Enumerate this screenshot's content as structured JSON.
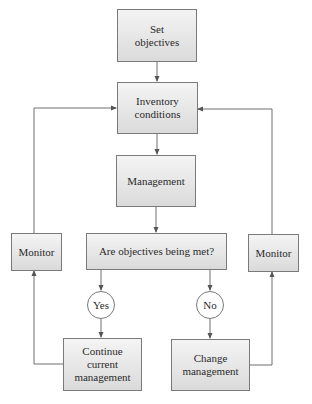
{
  "diagram": {
    "type": "flowchart",
    "nodes": {
      "set_objectives": "Set\nobjectives",
      "inventory_conditions": "Inventory\nconditions",
      "management": "Management",
      "question": "Are objectives being met?",
      "monitor_left": "Monitor",
      "monitor_right": "Monitor",
      "yes": "Yes",
      "no": "No",
      "continue_management": "Continue\ncurrent\nmanagement",
      "change_management": "Change\nmanagement"
    },
    "edges": [
      {
        "from": "Set objectives",
        "to": "Inventory conditions"
      },
      {
        "from": "Inventory conditions",
        "to": "Management"
      },
      {
        "from": "Management",
        "to": "Are objectives being met?"
      },
      {
        "from": "Are objectives being met?",
        "to": "Yes"
      },
      {
        "from": "Are objectives being met?",
        "to": "No"
      },
      {
        "from": "Yes",
        "to": "Continue current management"
      },
      {
        "from": "No",
        "to": "Change management"
      },
      {
        "from": "Continue current management",
        "to": "Monitor (left)"
      },
      {
        "from": "Monitor (left)",
        "to": "Inventory conditions"
      },
      {
        "from": "Change management",
        "to": "Monitor (right)"
      },
      {
        "from": "Monitor (right)",
        "to": "Inventory conditions"
      }
    ],
    "colors": {
      "line": "#6e6e6e",
      "box_border": "#7a7a7a",
      "box_fill_top": "#f4f4f4",
      "box_fill_bottom": "#dadada"
    }
  }
}
